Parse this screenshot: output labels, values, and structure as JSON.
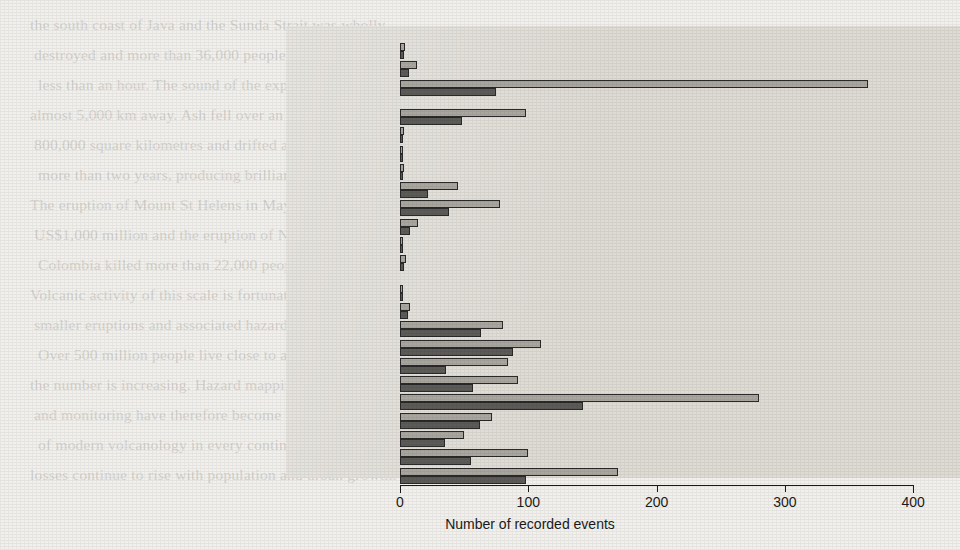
{
  "chart_data": {
    "type": "bar",
    "orientation": "horizontal",
    "title": "",
    "xlabel": "Number of recorded events",
    "ylabel": "",
    "xlim": [
      0,
      400
    ],
    "xticks": [
      0,
      100,
      200,
      300,
      400
    ],
    "grid": false,
    "legend": "none",
    "series": [
      {
        "name": "upper",
        "color": "#a9a6a0",
        "values": [
          4,
          13,
          365,
          98,
          3,
          2,
          3,
          45,
          78,
          14,
          2,
          5,
          2,
          8,
          80,
          110,
          84,
          92,
          280,
          72,
          50,
          100,
          170
        ]
      },
      {
        "name": "lower",
        "color": "#5d5b58",
        "values": [
          3,
          7,
          75,
          48,
          2,
          1,
          2,
          22,
          38,
          8,
          1,
          3,
          1,
          6,
          63,
          88,
          36,
          57,
          143,
          62,
          35,
          55,
          98
        ]
      }
    ],
    "categories": [
      "Red Sea",
      "Black Sea",
      "Mediterranean Sea",
      "Indian Ocean & West Coast Australia",
      "SE Atlantic",
      "SW Atlantic",
      "NW Atlantic",
      "NE Atlantic",
      "Caribbean Sea",
      "East Coast USA & Canada",
      "Gulf of Mexico",
      "West Coast Africa",
      "Central Africa",
      "Hawaii",
      "Eastern Australia, New Zealand, South Pacific",
      "New Caledonia, New Guinea, Solomon Is., Vanuatu",
      "Indonesia & Malaysia",
      "China, Korea, Philippines, Taiwan",
      "Japan",
      "Kamchatka & Kuril Islands",
      "Alaska & Aleutian Islands",
      "West Coast North & Central America",
      "West Coast South America"
    ],
    "group_gaps_after": [
      3,
      12
    ]
  },
  "axis": {
    "tick_labels": [
      "0",
      "100",
      "200",
      "300",
      "400"
    ],
    "x_axis_title": "Number of recorded events"
  },
  "colors": {
    "page_background": "#f2f0ec",
    "panel_background": "#dedbd4",
    "bar_upper": "#a9a6a0",
    "bar_lower": "#5d5b58",
    "ink": "#1b1b1b"
  },
  "background_text": {
    "lines": [
      "... ... ... ... ... ... ... ... ... ... ... ... ... ... ... ... ... ...",
      "... ... ... ... ... ... ... ... ... ... ... ... ... ... ... ... ... ..."
    ]
  }
}
